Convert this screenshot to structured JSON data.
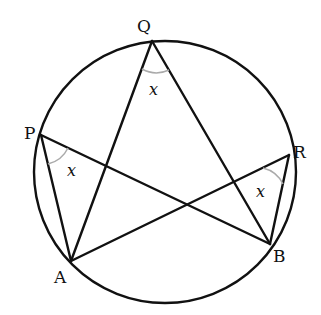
{
  "diagram": {
    "circle": {
      "cx": 165,
      "cy": 172,
      "r": 131
    },
    "points": {
      "Q": {
        "label": "Q",
        "x": 152,
        "y": 41
      },
      "P": {
        "label": "P",
        "x": 41,
        "y": 135
      },
      "R": {
        "label": "R",
        "x": 289,
        "y": 155
      },
      "B": {
        "label": "B",
        "x": 270,
        "y": 244
      },
      "A": {
        "label": "A",
        "x": 71,
        "y": 261
      }
    },
    "segments": [
      [
        "Q",
        "A"
      ],
      [
        "Q",
        "B"
      ],
      [
        "P",
        "A"
      ],
      [
        "P",
        "B"
      ],
      [
        "R",
        "A"
      ],
      [
        "R",
        "B"
      ]
    ],
    "angle_label": "x",
    "angle_marks": [
      "Q",
      "P",
      "R"
    ],
    "colors": {
      "stroke": "#111111",
      "arc": "#aaaaaa"
    }
  }
}
